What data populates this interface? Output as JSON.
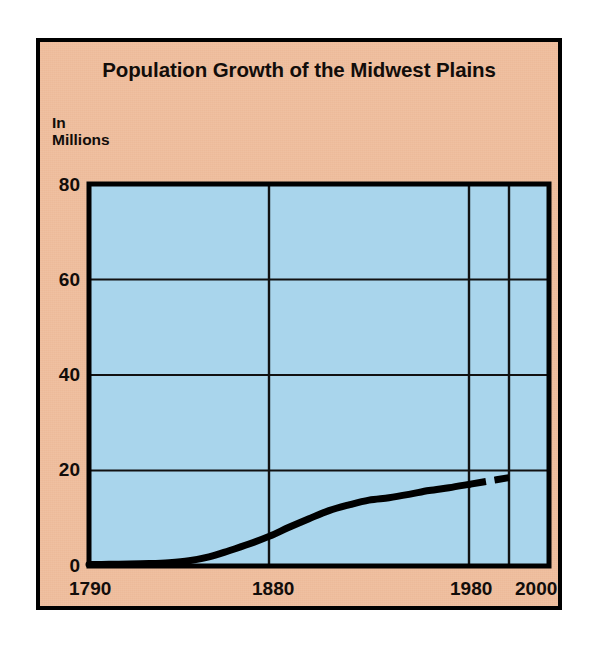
{
  "figure": {
    "title": "Population Growth of the Midwest Plains",
    "y_axis_title_line1": "In",
    "y_axis_title_line2": "Millions",
    "panel_background_color": "#EFBD9C",
    "plot_background_color": "#A9D5EC",
    "line_color": "#000000",
    "border_color": "#000000"
  },
  "chart_data": {
    "type": "line",
    "title": "Population Growth of the Midwest Plains",
    "subtitle": "",
    "xlabel": "",
    "ylabel": "In Millions",
    "xlim": [
      1790,
      2020
    ],
    "ylim": [
      0,
      80
    ],
    "x_ticks": [
      1790,
      1880,
      1980,
      2000
    ],
    "x_tick_labels": [
      "1790",
      "1880",
      "1980",
      "2000"
    ],
    "y_ticks": [
      0,
      20,
      40,
      60,
      80
    ],
    "y_tick_labels": [
      "0",
      "20",
      "40",
      "60",
      "80"
    ],
    "grid": "both",
    "legend": "none",
    "series": [
      {
        "name": "Midwest Plains population",
        "style": "solid",
        "note": "historical",
        "x": [
          1790,
          1800,
          1810,
          1820,
          1830,
          1840,
          1850,
          1860,
          1870,
          1880,
          1890,
          1900,
          1910,
          1920,
          1930,
          1940,
          1950,
          1960,
          1970,
          1980
        ],
        "y": [
          0.3,
          0.35,
          0.4,
          0.5,
          0.7,
          1.1,
          1.9,
          3.2,
          4.6,
          6.2,
          8.1,
          9.9,
          11.6,
          12.8,
          13.8,
          14.3,
          15.0,
          15.8,
          16.4,
          17.1
        ]
      },
      {
        "name": "Midwest Plains population (projected)",
        "style": "dashed",
        "note": "projection",
        "x": [
          1980,
          1990,
          2000
        ],
        "y": [
          17.1,
          17.8,
          18.5
        ]
      }
    ]
  },
  "axis_labels": {
    "y": [
      "80",
      "60",
      "40",
      "20",
      "0"
    ],
    "x": [
      "1790",
      "1880",
      "1980",
      "2000"
    ]
  }
}
